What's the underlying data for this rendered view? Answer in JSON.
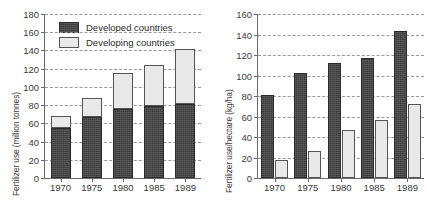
{
  "chart_data": [
    {
      "type": "bar",
      "subtype": "stacked",
      "panel": "left",
      "title": "",
      "xlabel": "",
      "ylabel": "Fertilizer use (million tonnes)",
      "categories": [
        "1970",
        "1975",
        "1980",
        "1985",
        "1989"
      ],
      "ylim": [
        0,
        180
      ],
      "yticks": [
        0,
        20,
        40,
        60,
        80,
        100,
        120,
        140,
        160,
        180
      ],
      "grid": true,
      "legend": [
        "Developed countries",
        "Developing countries"
      ],
      "legend_position": "top-left-inside",
      "series": [
        {
          "name": "Developed countries",
          "color": "#3b3b3b",
          "values": [
            55,
            67,
            76,
            79,
            81
          ]
        },
        {
          "name": "Developing countries",
          "color": "#e9e9e9",
          "values": [
            13,
            21,
            39,
            45,
            61
          ]
        }
      ],
      "totals": [
        68,
        88,
        115,
        124,
        142
      ]
    },
    {
      "type": "bar",
      "subtype": "grouped",
      "panel": "right",
      "title": "",
      "xlabel": "",
      "ylabel": "Fertilizer use/hectare (kg/ha)",
      "categories": [
        "1970",
        "1975",
        "1980",
        "1985",
        "1989"
      ],
      "ylim": [
        0,
        160
      ],
      "yticks": [
        0,
        20,
        40,
        60,
        80,
        100,
        120,
        140,
        160
      ],
      "grid": true,
      "legend": [],
      "series": [
        {
          "name": "Developed countries",
          "color": "#3b3b3b",
          "values": [
            81,
            102,
            112,
            117,
            143
          ]
        },
        {
          "name": "Developing countries",
          "color": "#e9e9e9",
          "values": [
            18,
            26,
            47,
            57,
            72
          ]
        }
      ]
    }
  ],
  "legend": {
    "developed_label": "Developed countries",
    "developing_label": "Developing countries"
  },
  "colors": {
    "developed": "#3b3b3b",
    "developing": "#e9e9e9",
    "axis": "#6a6a6a",
    "grid": "#9a9a9a",
    "text": "#2b2b2b"
  }
}
